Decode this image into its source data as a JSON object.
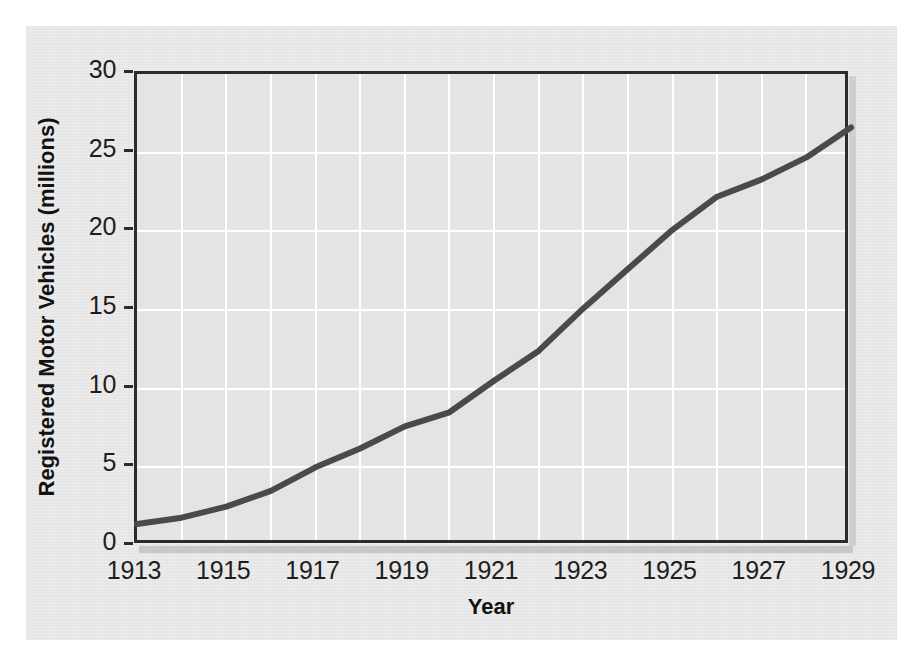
{
  "figure": {
    "panel_bg": "#e8e8e8",
    "plot_bg": "#e4e4e4",
    "axis_color": "#2b2b2b",
    "grid_color": "#ffffff",
    "line_color": "#4a4a4a"
  },
  "chart_data": {
    "type": "line",
    "title": "",
    "subtitle": "",
    "xlabel": "Year",
    "ylabel": "Registered Motor Vehicles (millions)",
    "xlim": [
      1913,
      1929
    ],
    "ylim": [
      0,
      30
    ],
    "grid": true,
    "legend": "none",
    "x_tick_labels": [
      "1913",
      "1915",
      "1917",
      "1919",
      "1921",
      "1923",
      "1925",
      "1927",
      "1929"
    ],
    "x_tick_values": [
      1913,
      1915,
      1917,
      1919,
      1921,
      1923,
      1925,
      1927,
      1929
    ],
    "y_tick_labels": [
      "0",
      "5",
      "10",
      "15",
      "20",
      "25",
      "30"
    ],
    "y_tick_values": [
      0,
      5,
      10,
      15,
      20,
      25,
      30
    ],
    "x_minor_gridlines_every": 1,
    "y_major_gridlines_every": 5,
    "x": [
      1913,
      1914,
      1915,
      1916,
      1917,
      1918,
      1919,
      1920,
      1921,
      1922,
      1923,
      1924,
      1925,
      1926,
      1927,
      1928,
      1929
    ],
    "series": [
      {
        "name": "Registered Motor Vehicles",
        "values": [
          1.4,
          1.8,
          2.5,
          3.5,
          5.0,
          6.2,
          7.6,
          8.5,
          10.5,
          12.4,
          15.1,
          17.6,
          20.1,
          22.2,
          23.3,
          24.7,
          26.6
        ]
      }
    ]
  }
}
